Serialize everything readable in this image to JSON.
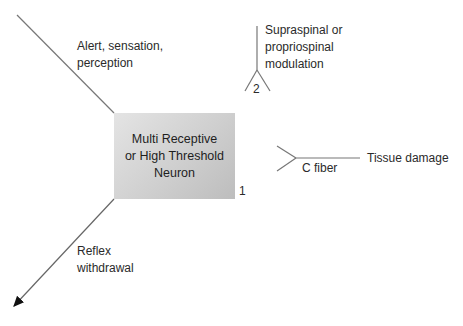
{
  "neuron": {
    "line1": "Multi Receptive",
    "line2": "or High Threshold",
    "line3": "Neuron",
    "number": "1"
  },
  "outputs": {
    "alert": {
      "line1": "Alert, sensation,",
      "line2": "perception"
    },
    "reflex": {
      "line1": "Reflex",
      "line2": "withdrawal"
    }
  },
  "inputs": {
    "modulation": {
      "line1": "Supraspinal or",
      "line2": "propriospinal",
      "line3": "modulation",
      "number": "2"
    },
    "c_fiber": {
      "label": "C fiber",
      "source": "Tissue damage"
    }
  },
  "colors": {
    "line": "#777777",
    "box_light": "#e4e4e4",
    "box_dark": "#bdbdbd"
  }
}
